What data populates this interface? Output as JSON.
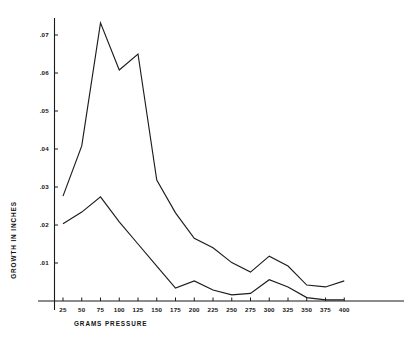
{
  "chart_data": {
    "type": "line",
    "title": "",
    "xlabel": "GRAMS PRESSURE",
    "ylabel": "GROWTH IN INCHES",
    "x": [
      25,
      50,
      75,
      100,
      125,
      150,
      175,
      200,
      225,
      250,
      275,
      300,
      325,
      350,
      375,
      400
    ],
    "xlim": [
      12,
      412
    ],
    "ylim": [
      0,
      0.0755
    ],
    "grid": false,
    "legend": null,
    "xtick_labels": [
      "25",
      "50",
      "75",
      "100",
      "125",
      "150",
      "175",
      "200",
      "225",
      "250",
      "275",
      "300",
      "325",
      "350",
      "375",
      "400"
    ],
    "ytick_values": [
      0.01,
      0.02,
      0.03,
      0.04,
      0.05,
      0.06,
      0.07
    ],
    "ytick_labels": [
      ".01",
      ".02",
      ".03",
      ".04",
      ".05",
      ".06",
      ".07"
    ],
    "series": [
      {
        "name": "upper",
        "values": [
          0.0276,
          0.0408,
          0.0732,
          0.0608,
          0.065,
          0.0318,
          0.0232,
          0.0165,
          0.014,
          0.0101,
          0.0076,
          0.0118,
          0.0092,
          0.0042,
          0.0037,
          0.0053
        ]
      },
      {
        "name": "lower",
        "values": [
          0.0203,
          0.0234,
          0.0274,
          0.0208,
          0.015,
          0.0092,
          0.0034,
          0.0053,
          0.0029,
          0.0016,
          0.002,
          0.0056,
          0.0037,
          0.0009,
          0.0003,
          0.0003
        ]
      }
    ],
    "colors": {
      "line": "#1c1c1c",
      "axis": "#1a1a1a",
      "background": "#ffffff"
    }
  }
}
